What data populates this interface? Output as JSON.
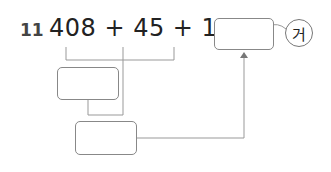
{
  "problem": {
    "number": "11",
    "expression": "408 + 45 + 12 =",
    "label": "거"
  },
  "boxes": {
    "answer": "",
    "first_sum": "",
    "second_sum": ""
  }
}
